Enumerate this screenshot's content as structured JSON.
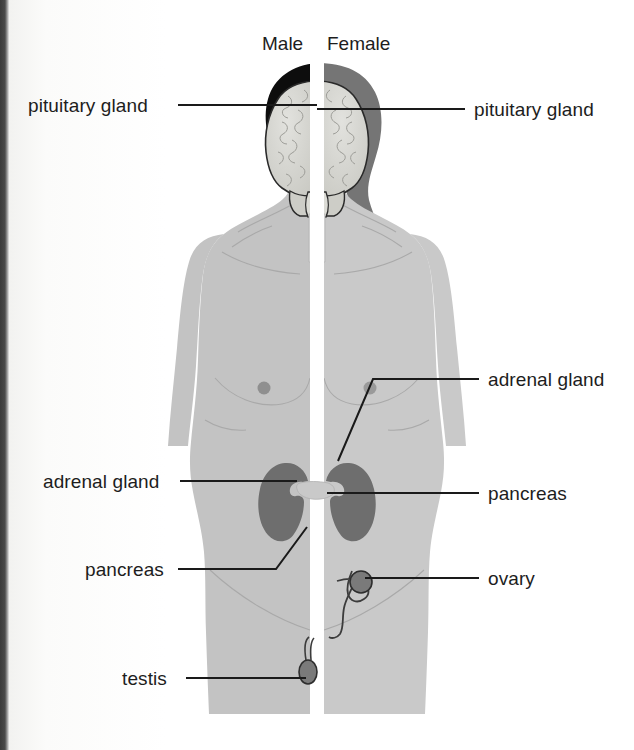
{
  "figure": {
    "type": "anatomical-diagram",
    "headers": [
      {
        "id": "male",
        "label": "Male"
      },
      {
        "id": "female",
        "label": "Female"
      }
    ],
    "labels": [
      {
        "id": "pituitary-gland-left",
        "text": "pituitary gland",
        "side": "left"
      },
      {
        "id": "pituitary-gland-right",
        "text": "pituitary gland",
        "side": "right"
      },
      {
        "id": "adrenal-gland-right",
        "text": "adrenal gland",
        "side": "right"
      },
      {
        "id": "adrenal-gland-left",
        "text": "adrenal gland",
        "side": "left"
      },
      {
        "id": "pancreas-right",
        "text": "pancreas",
        "side": "right"
      },
      {
        "id": "pancreas-left",
        "text": "pancreas",
        "side": "left"
      },
      {
        "id": "ovary",
        "text": "ovary",
        "side": "right"
      },
      {
        "id": "testis",
        "text": "testis",
        "side": "left"
      }
    ],
    "colors": {
      "body_fill": "#c3c3c3",
      "body_fill_female": "#c9c9c9",
      "hair_male": "#0d0d0d",
      "hair_female": "#757575",
      "brain_fill": "#d6d6d2",
      "organ_dark": "#6e6e6e",
      "pancreas_fill": "#c9c9c9",
      "leader_line": "#1a1a1a",
      "text": "#1d1d1d",
      "background": "#ffffff",
      "divider": "#ffffff",
      "gutter": "#3b3b3b"
    }
  }
}
